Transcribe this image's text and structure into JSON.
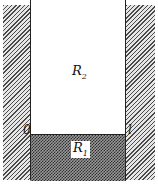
{
  "diagram": {
    "regions": [
      {
        "id": "R2",
        "base": "R",
        "subscript": "2",
        "fill": "#ffffff",
        "description": "upper open region"
      },
      {
        "id": "R1",
        "base": "R",
        "subscript": "1",
        "fill": "#555555",
        "description": "lower dense region"
      }
    ],
    "walls": [
      {
        "side": "left",
        "pattern": "diagonal-hatch"
      },
      {
        "side": "right",
        "pattern": "diagonal-hatch"
      }
    ],
    "axis_labels": {
      "left": "0",
      "right": "l"
    },
    "labels": {
      "r2_base": "R",
      "r2_sub": "2",
      "r1_base": "R",
      "r1_sub": "1"
    }
  }
}
